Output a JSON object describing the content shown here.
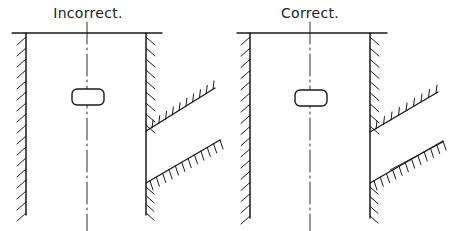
{
  "diagrams": [
    {
      "label": "Incorrect.",
      "label_pos": [
        88,
        6
      ],
      "top_line": [
        12,
        33,
        162
      ],
      "left_wall_x": 26,
      "right_wall_x": 146,
      "wall_bottom_y": 215,
      "centerline_x": 87,
      "slot": {
        "cx": 88,
        "cy": 97,
        "w": 32,
        "h": 16
      },
      "upper_branch": [
        [
          146,
          131
        ],
        [
          215,
          88
        ]
      ],
      "lower_branch": [
        [
          146,
          183
        ],
        [
          220,
          140
        ]
      ],
      "lower_branch_double_line": false
    },
    {
      "label": "Correct.",
      "label_pos": [
        310,
        6
      ],
      "top_line": [
        237,
        33,
        387
      ],
      "left_wall_x": 250,
      "right_wall_x": 370,
      "wall_bottom_y": 218,
      "centerline_x": 310,
      "slot": {
        "cx": 311,
        "cy": 98,
        "w": 32,
        "h": 16
      },
      "upper_branch": [
        [
          370,
          132
        ],
        [
          438,
          92
        ]
      ],
      "lower_branch": [
        [
          370,
          183
        ],
        [
          443,
          141
        ]
      ],
      "lower_branch_double_line": true
    }
  ],
  "colors": {
    "ink": "#1a1a1a",
    "background": "#ffffff"
  }
}
